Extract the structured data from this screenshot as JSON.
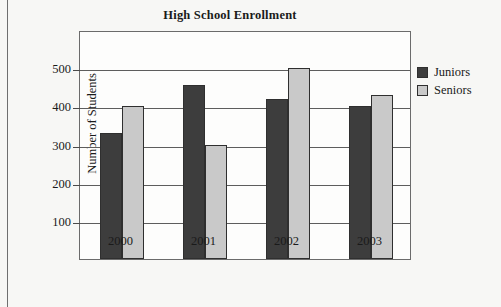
{
  "chart_data": {
    "type": "bar",
    "title": "High School Enrollment",
    "xlabel": "",
    "ylabel": "Number of Students",
    "categories": [
      "2000",
      "2001",
      "2002",
      "2003"
    ],
    "series": [
      {
        "name": "Juniors",
        "color": "#3d3d3d",
        "values": [
          330,
          455,
          420,
          400
        ]
      },
      {
        "name": "Seniors",
        "color": "#c9c9c9",
        "values": [
          400,
          300,
          500,
          430
        ]
      }
    ],
    "ylim": [
      0,
      600
    ],
    "yticks": [
      100,
      200,
      300,
      400,
      500
    ],
    "ytick_labels": [
      "100",
      "200",
      "300",
      "400",
      "500"
    ],
    "grid": true,
    "grid_axis": "y",
    "legend_position": "right"
  }
}
